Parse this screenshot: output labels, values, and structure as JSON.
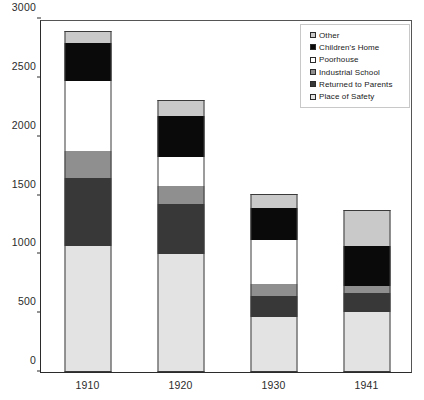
{
  "chart_data": {
    "type": "bar",
    "subtype": "stacked",
    "title": "",
    "xlabel": "",
    "ylabel": "",
    "categories": [
      "1910",
      "1920",
      "1930",
      "1941"
    ],
    "ylim": [
      0,
      3000
    ],
    "yticks": [
      0,
      500,
      1000,
      1500,
      2000,
      2500,
      3000
    ],
    "ytick_labels": [
      "0",
      "500",
      "1000",
      "1500",
      "2000",
      "2500",
      "3000"
    ],
    "grid": false,
    "legend_position": "top-right",
    "stack_order_bottom_to_top": [
      "Place of Safety",
      "Returned to Parents",
      "Industrial School",
      "Poorhouse",
      "Children's Home",
      "Other"
    ],
    "series": [
      {
        "name": "Place of Safety",
        "color": "#e3e3e3",
        "values": [
          1070,
          1005,
          470,
          510
        ]
      },
      {
        "name": "Returned to Parents",
        "color": "#383838",
        "values": [
          580,
          420,
          175,
          165
        ]
      },
      {
        "name": "Industrial School",
        "color": "#8f8f8f",
        "values": [
          225,
          155,
          105,
          55
        ]
      },
      {
        "name": "Poorhouse",
        "color": "#ffffff",
        "values": [
          595,
          245,
          375,
          0
        ]
      },
      {
        "name": "Children's Home",
        "color": "#0a0a0a",
        "values": [
          325,
          350,
          265,
          340
        ]
      },
      {
        "name": "Other",
        "color": "#c9c9c9",
        "values": [
          105,
          135,
          120,
          305
        ]
      }
    ],
    "totals": [
      2900,
      2310,
      1510,
      1375
    ]
  },
  "legend": {
    "items": [
      {
        "label": "Other",
        "color": "#c9c9c9"
      },
      {
        "label": "Children's Home",
        "color": "#0a0a0a"
      },
      {
        "label": "Poorhouse",
        "color": "#ffffff"
      },
      {
        "label": "Industrial School",
        "color": "#8f8f8f"
      },
      {
        "label": "Returned to Parents",
        "color": "#383838"
      },
      {
        "label": "Place of Safety",
        "color": "#e3e3e3"
      }
    ]
  },
  "axes": {
    "y_max_label": "3000",
    "y_min_label": "0"
  }
}
